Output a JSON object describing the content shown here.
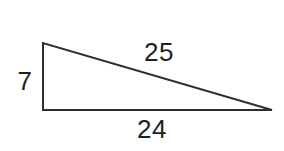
{
  "figure": {
    "labels": {
      "left_side": "7",
      "hypotenuse": "25",
      "base": "24"
    },
    "colors": {
      "line": "#2e2e2e",
      "text": "#1f1f1f",
      "background": "#ffffff"
    }
  }
}
